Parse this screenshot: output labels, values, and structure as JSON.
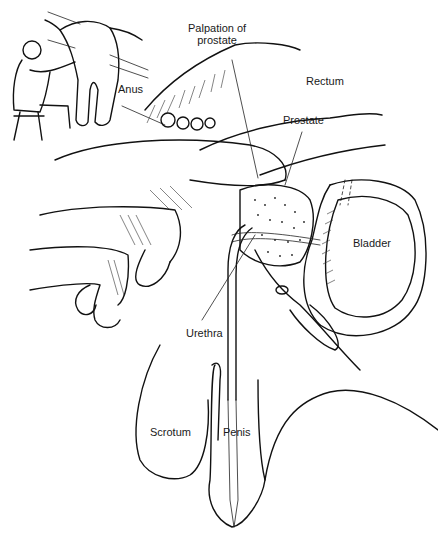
{
  "figure": {
    "title": "Palpation of prostate",
    "labels": {
      "palpation_line1": "Palpation of",
      "palpation_line2": "prostate",
      "anus": "Anus",
      "rectum": "Rectum",
      "prostate": "Prostate",
      "bladder": "Bladder",
      "urethra": "Urethra",
      "scrotum": "Scrotum",
      "penis": "Penis"
    },
    "colors": {
      "ink": "#111111",
      "background": "#ffffff"
    }
  }
}
